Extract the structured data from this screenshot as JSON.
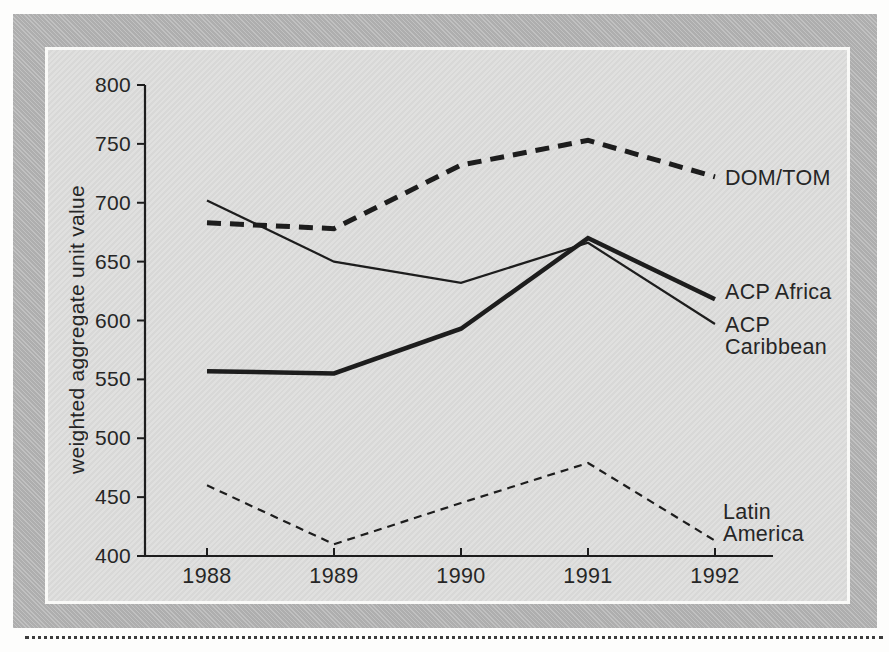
{
  "figure": {
    "ink": "#1d1d1d",
    "frame_color": "#b5b5b5",
    "panel_color": "#dcdcdb"
  },
  "chart_data": {
    "type": "line",
    "title": "",
    "xlabel": "",
    "ylabel": "weighted aggregate unit value",
    "categories": [
      "1988",
      "1989",
      "1990",
      "1991",
      "1992"
    ],
    "ylim": [
      400,
      800
    ],
    "ytick_step": 50,
    "grid": false,
    "legend_position": "right-of-line-ends",
    "series": [
      {
        "name": "DOM/TOM",
        "label": "DOM/TOM",
        "values": [
          683,
          678,
          732,
          753,
          722
        ],
        "line_style": "dashed",
        "weight": "thick"
      },
      {
        "name": "ACP Africa",
        "label": "ACP Africa",
        "values": [
          557,
          555,
          593,
          670,
          618
        ],
        "line_style": "solid",
        "weight": "thick"
      },
      {
        "name": "ACP Caribbean",
        "label": "ACP\nCaribbean",
        "values": [
          702,
          650,
          632,
          666,
          597
        ],
        "line_style": "solid",
        "weight": "thin"
      },
      {
        "name": "Latin America",
        "label": "Latin\nAmerica",
        "values": [
          460,
          410,
          445,
          479,
          413
        ],
        "line_style": "dashed",
        "weight": "thin"
      }
    ]
  }
}
